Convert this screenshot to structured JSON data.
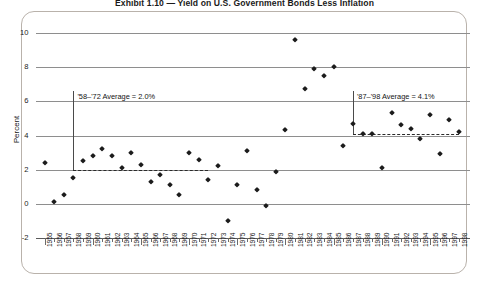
{
  "chart_data": {
    "type": "scatter",
    "title": "Exhibit 1.10 — Yield on U.S. Government Bonds Less Inflation",
    "xlabel": "",
    "ylabel": "Percent",
    "ylim": [
      -2,
      10
    ],
    "yticks": [
      -2,
      0,
      2,
      4,
      6,
      8,
      10
    ],
    "ytick_labels": [
      "-2",
      "0",
      "2",
      "4",
      "6",
      "8",
      "10"
    ],
    "grid": true,
    "legend": "none",
    "xlim": [
      1955,
      1998
    ],
    "categories": [
      "1955",
      "1956",
      "1957",
      "1958",
      "1959",
      "1960",
      "1961",
      "1962",
      "1963",
      "1964",
      "1965",
      "1966",
      "1967",
      "1968",
      "1969",
      "1970",
      "1971",
      "1972",
      "1973",
      "1974",
      "1975",
      "1976",
      "1977",
      "1978",
      "1979",
      "1980",
      "1981",
      "1982",
      "1983",
      "1984",
      "1985",
      "1986",
      "1987",
      "1988",
      "1989",
      "1990",
      "1991",
      "1992",
      "1993",
      "1994",
      "1995",
      "1996",
      "1997",
      "1998"
    ],
    "values": [
      2.4,
      0.1,
      0.5,
      1.5,
      2.5,
      2.8,
      3.2,
      2.8,
      2.1,
      3.0,
      2.3,
      1.3,
      1.7,
      1.1,
      0.5,
      3.0,
      2.6,
      1.4,
      2.2,
      -1.0,
      1.1,
      3.1,
      0.8,
      -0.1,
      1.9,
      4.3,
      9.6,
      6.7,
      7.9,
      7.5,
      8.0,
      3.4,
      4.7,
      4.1,
      4.1,
      2.1,
      5.3,
      4.6,
      4.4,
      3.8,
      5.2,
      2.9,
      4.9,
      4.2
    ],
    "annotations": [
      {
        "name": "left-average-label",
        "text": "'58–'72 Average = 2.0%",
        "value": 2.0,
        "span_start": "1958",
        "span_end": "1972"
      },
      {
        "name": "right-average-label",
        "text": "'87–'98 Average = 4.1%",
        "value": 4.1,
        "span_start": "1987",
        "span_end": "1998"
      }
    ],
    "colors": {
      "marker": "#1c1c1c",
      "gridline": "#8e8e8e",
      "panel_border": "#b9b2ab",
      "annotation_rule": "#4a4a4a",
      "background": "#ffffff"
    }
  }
}
